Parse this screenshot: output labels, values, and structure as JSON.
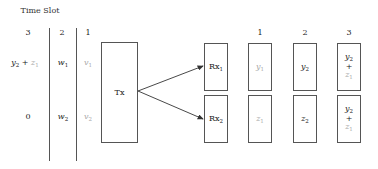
{
  "header": {
    "title": "Time Slot"
  },
  "timeline": {
    "slots": [
      {
        "label": "3",
        "row1": {
          "main": "y",
          "main_sub": "2",
          "op": "+",
          "faded": "z",
          "faded_sub": "1"
        },
        "row2": "0"
      },
      {
        "label": "2",
        "row1": {
          "main": "w",
          "main_sub": "1"
        },
        "row2": {
          "main": "w",
          "main_sub": "2"
        }
      },
      {
        "label": "1",
        "row1": {
          "faded": "v",
          "faded_sub": "1"
        },
        "row2": {
          "faded": "v",
          "faded_sub": "2"
        }
      }
    ]
  },
  "transmitter": {
    "label": "Tx"
  },
  "receivers": [
    {
      "label": "Rx",
      "sub": "1"
    },
    {
      "label": "Rx",
      "sub": "2"
    }
  ],
  "received": {
    "columns": [
      "1",
      "2",
      "3"
    ],
    "rx1": [
      {
        "faded": "y",
        "faded_sub": "1"
      },
      {
        "main": "y",
        "main_sub": "2"
      },
      {
        "main": "y",
        "main_sub": "2",
        "op": "+",
        "faded": "z",
        "faded_sub": "1"
      }
    ],
    "rx2": [
      {
        "faded": "z",
        "faded_sub": "1"
      },
      {
        "main": "z",
        "main_sub": "2"
      },
      {
        "main": "y",
        "main_sub": "2",
        "op": "+",
        "faded": "z",
        "faded_sub": "1"
      }
    ]
  },
  "colors": {
    "line": "#555555",
    "faded_text": "#a8a8a8",
    "text": "#222222"
  }
}
